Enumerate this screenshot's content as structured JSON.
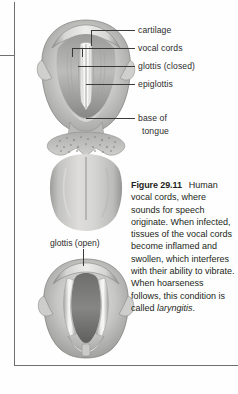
{
  "figure": {
    "number_label": "Figure 29.11",
    "caption_text": "Human vocal cords, where sounds for speech originate. When infected, tissues of the vocal cords become inflamed and swollen, which interferes with their ability to vibrate. When hoarseness follows, this condition is called ",
    "caption_term": "laryngitis",
    "caption_end": "."
  },
  "labels": {
    "cartilage": "cartilage",
    "vocal_cords": "vocal cords",
    "glottis_closed": "glottis (closed)",
    "epiglottis": "epiglottis",
    "base_of_tongue_line1": "base of",
    "base_of_tongue_line2": "tongue",
    "glottis_open": "glottis (open)"
  },
  "illustrations": {
    "upper": "larynx-superior-view-glottis-closed-with-tongue",
    "lower": "larynx-superior-view-glottis-open"
  },
  "colors": {
    "text": "#231f20",
    "leader_line": "#3a3a3a",
    "rule_line": "#6f6f6f",
    "tissue_light": "#d9d9d7",
    "tissue_mid": "#b6b6b4",
    "tissue_dark": "#8e8e8c",
    "tissue_shadow": "#6d6d6b",
    "highlight": "#f2f2f0",
    "page_background": "#fefefe"
  }
}
